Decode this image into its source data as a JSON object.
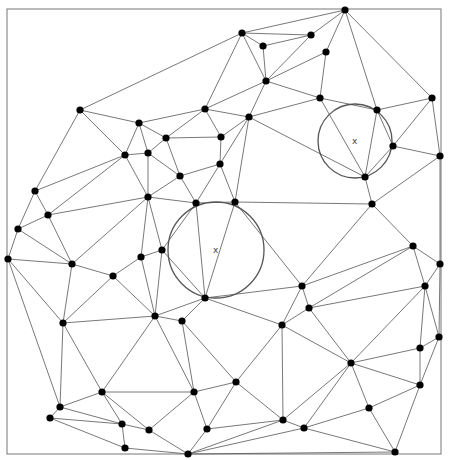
{
  "diagram": {
    "type": "delaunay-triangulation",
    "frame": {
      "x": 7,
      "y": 9,
      "w": 434,
      "h": 445
    },
    "circumcircles": [
      {
        "cx": 216,
        "cy": 250,
        "r": 48,
        "label": "x"
      },
      {
        "cx": 355,
        "cy": 141,
        "r": 37,
        "label": "x"
      }
    ],
    "nodes": {
      "T": [
        345,
        10
      ],
      "Q": [
        242,
        33
      ],
      "R": [
        263,
        46
      ],
      "S": [
        311,
        35
      ],
      "U": [
        326,
        52
      ],
      "V": [
        266,
        81
      ],
      "W": [
        320,
        98
      ],
      "X": [
        377,
        110
      ],
      "Y": [
        432,
        98
      ],
      "Z": [
        393,
        146
      ],
      "AA": [
        440,
        156
      ],
      "AB": [
        365,
        177
      ],
      "AC": [
        372,
        204
      ],
      "A": [
        80,
        110
      ],
      "B": [
        139,
        123
      ],
      "I": [
        205,
        109
      ],
      "J": [
        249,
        117
      ],
      "K": [
        166,
        138
      ],
      "L": [
        221,
        137
      ],
      "C": [
        125,
        155
      ],
      "D": [
        148,
        153
      ],
      "M": [
        220,
        164
      ],
      "N": [
        180,
        176
      ],
      "E": [
        35,
        191
      ],
      "G": [
        148,
        197
      ],
      "O": [
        196,
        203
      ],
      "P": [
        235,
        202
      ],
      "F": [
        48,
        215
      ],
      "H": [
        18,
        229
      ],
      "AK": [
        8,
        259
      ],
      "AL": [
        72,
        264
      ],
      "AM": [
        113,
        276
      ],
      "AN": [
        141,
        257
      ],
      "AD": [
        162,
        250
      ],
      "AE": [
        205,
        298
      ],
      "AO": [
        63,
        323
      ],
      "AI": [
        155,
        316
      ],
      "AJ": [
        182,
        321
      ],
      "AF": [
        302,
        286
      ],
      "AG": [
        309,
        308
      ],
      "AH": [
        282,
        325
      ],
      "BH": [
        413,
        246
      ],
      "BI": [
        440,
        264
      ],
      "BJ": [
        425,
        286
      ],
      "BF": [
        439,
        337
      ],
      "BE": [
        420,
        348
      ],
      "BB": [
        351,
        363
      ],
      "BD": [
        420,
        385
      ],
      "BC": [
        369,
        408
      ],
      "AY": [
        236,
        382
      ],
      "AZ": [
        283,
        420
      ],
      "BA": [
        304,
        428
      ],
      "BG": [
        395,
        452
      ],
      "AW": [
        194,
        392
      ],
      "AX": [
        207,
        429
      ],
      "AP": [
        102,
        392
      ],
      "AQ": [
        60,
        407
      ],
      "AR": [
        50,
        418
      ],
      "AS": [
        122,
        424
      ],
      "AT": [
        149,
        430
      ],
      "AU": [
        125,
        448
      ],
      "AV": [
        188,
        454
      ]
    },
    "edges": [
      [
        "Q",
        "T"
      ],
      [
        "Q",
        "S"
      ],
      [
        "Q",
        "R"
      ],
      [
        "Q",
        "V"
      ],
      [
        "Q",
        "I"
      ],
      [
        "Q",
        "A"
      ],
      [
        "S",
        "T"
      ],
      [
        "S",
        "R"
      ],
      [
        "S",
        "V"
      ],
      [
        "T",
        "U"
      ],
      [
        "T",
        "X"
      ],
      [
        "T",
        "Y"
      ],
      [
        "U",
        "V"
      ],
      [
        "U",
        "W"
      ],
      [
        "V",
        "W"
      ],
      [
        "V",
        "I"
      ],
      [
        "V",
        "J"
      ],
      [
        "R",
        "V"
      ],
      [
        "J",
        "W"
      ],
      [
        "W",
        "X"
      ],
      [
        "W",
        "AB"
      ],
      [
        "X",
        "Y"
      ],
      [
        "X",
        "Z"
      ],
      [
        "X",
        "AB"
      ],
      [
        "Y",
        "Z"
      ],
      [
        "Y",
        "AA"
      ],
      [
        "Z",
        "AA"
      ],
      [
        "Z",
        "AB"
      ],
      [
        "AA",
        "AC"
      ],
      [
        "AB",
        "AC"
      ],
      [
        "J",
        "AB"
      ],
      [
        "AC",
        "P"
      ],
      [
        "AA",
        "BI"
      ],
      [
        "A",
        "B"
      ],
      [
        "A",
        "C"
      ],
      [
        "A",
        "E"
      ],
      [
        "B",
        "C"
      ],
      [
        "B",
        "D"
      ],
      [
        "C",
        "D"
      ],
      [
        "C",
        "E"
      ],
      [
        "C",
        "F"
      ],
      [
        "E",
        "F"
      ],
      [
        "F",
        "G"
      ],
      [
        "C",
        "G"
      ],
      [
        "D",
        "G"
      ],
      [
        "E",
        "H"
      ],
      [
        "F",
        "H"
      ],
      [
        "B",
        "I"
      ],
      [
        "I",
        "J"
      ],
      [
        "I",
        "K"
      ],
      [
        "I",
        "L"
      ],
      [
        "J",
        "L"
      ],
      [
        "J",
        "M"
      ],
      [
        "J",
        "P"
      ],
      [
        "B",
        "K"
      ],
      [
        "K",
        "D"
      ],
      [
        "K",
        "L"
      ],
      [
        "K",
        "N"
      ],
      [
        "L",
        "M"
      ],
      [
        "M",
        "N"
      ],
      [
        "N",
        "D"
      ],
      [
        "N",
        "G"
      ],
      [
        "N",
        "O"
      ],
      [
        "M",
        "O"
      ],
      [
        "M",
        "P"
      ],
      [
        "G",
        "O"
      ],
      [
        "O",
        "P"
      ],
      [
        "O",
        "AD"
      ],
      [
        "O",
        "AE"
      ],
      [
        "P",
        "AE"
      ],
      [
        "P",
        "AF"
      ],
      [
        "AD",
        "AE"
      ],
      [
        "AE",
        "AF"
      ],
      [
        "AE",
        "AH"
      ],
      [
        "AE",
        "AI"
      ],
      [
        "AE",
        "AJ"
      ],
      [
        "AF",
        "AG"
      ],
      [
        "AF",
        "AH"
      ],
      [
        "AG",
        "AH"
      ],
      [
        "AF",
        "BH"
      ],
      [
        "AG",
        "BJ"
      ],
      [
        "H",
        "AK"
      ],
      [
        "H",
        "AL"
      ],
      [
        "AK",
        "AL"
      ],
      [
        "AK",
        "AO"
      ],
      [
        "AK",
        "AQ"
      ],
      [
        "AL",
        "AM"
      ],
      [
        "AL",
        "AO"
      ],
      [
        "AL",
        "G"
      ],
      [
        "AL",
        "F"
      ],
      [
        "AM",
        "AN"
      ],
      [
        "AM",
        "AO"
      ],
      [
        "AM",
        "AI"
      ],
      [
        "AN",
        "AD"
      ],
      [
        "AN",
        "AI"
      ],
      [
        "AN",
        "G"
      ],
      [
        "AD",
        "AI"
      ],
      [
        "AD",
        "G"
      ],
      [
        "AO",
        "AI"
      ],
      [
        "AI",
        "AJ"
      ],
      [
        "AO",
        "AP"
      ],
      [
        "AO",
        "AQ"
      ],
      [
        "AI",
        "AP"
      ],
      [
        "AI",
        "AW"
      ],
      [
        "AJ",
        "AW"
      ],
      [
        "AJ",
        "AY"
      ],
      [
        "AP",
        "AQ"
      ],
      [
        "AP",
        "AS"
      ],
      [
        "AP",
        "AT"
      ],
      [
        "AP",
        "AW"
      ],
      [
        "AQ",
        "AR"
      ],
      [
        "AQ",
        "AS"
      ],
      [
        "AR",
        "AS"
      ],
      [
        "AR",
        "AU"
      ],
      [
        "AS",
        "AT"
      ],
      [
        "AS",
        "AU"
      ],
      [
        "AT",
        "AW"
      ],
      [
        "AT",
        "AV"
      ],
      [
        "AU",
        "AV"
      ],
      [
        "AW",
        "AX"
      ],
      [
        "AW",
        "AY"
      ],
      [
        "AX",
        "AV"
      ],
      [
        "AX",
        "AY"
      ],
      [
        "AY",
        "AZ"
      ],
      [
        "AH",
        "AZ"
      ],
      [
        "AH",
        "AY"
      ],
      [
        "AZ",
        "BA"
      ],
      [
        "AZ",
        "BB"
      ],
      [
        "BA",
        "BB"
      ],
      [
        "BA",
        "BC"
      ],
      [
        "BA",
        "BG"
      ],
      [
        "BB",
        "BC"
      ],
      [
        "BB",
        "BD"
      ],
      [
        "BB",
        "BE"
      ],
      [
        "BC",
        "BD"
      ],
      [
        "BC",
        "BG"
      ],
      [
        "BD",
        "BE"
      ],
      [
        "BD",
        "BF"
      ],
      [
        "BD",
        "BG"
      ],
      [
        "BE",
        "BF"
      ],
      [
        "AZ",
        "AX"
      ],
      [
        "AZ",
        "AV"
      ],
      [
        "BA",
        "AV"
      ],
      [
        "BG",
        "AV"
      ],
      [
        "AC",
        "AF"
      ],
      [
        "AC",
        "BH"
      ],
      [
        "BH",
        "BI"
      ],
      [
        "BH",
        "BJ"
      ],
      [
        "BH",
        "AG"
      ],
      [
        "BI",
        "BJ"
      ],
      [
        "BI",
        "BF"
      ],
      [
        "BJ",
        "BE"
      ],
      [
        "BJ",
        "BF"
      ],
      [
        "BJ",
        "BB"
      ],
      [
        "AG",
        "BB"
      ],
      [
        "AH",
        "BB"
      ]
    ]
  }
}
